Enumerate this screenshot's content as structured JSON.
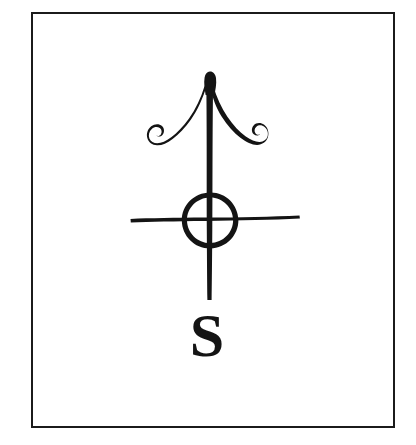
{
  "plate": {
    "name": "sigil-plate",
    "background_color": "#ffffff",
    "ink_color": "#141414",
    "width": 416,
    "height": 445
  },
  "frame": {
    "name": "plate-border",
    "border_color": "#1b1b1b",
    "border_width_px": 2.5,
    "x": 31,
    "y": 12,
    "width": 364,
    "height": 416
  },
  "figure": {
    "name": "alchemical-sigil",
    "elements": [
      {
        "name": "arrow-shaft",
        "label": "Vertical shaft",
        "top_y": 72,
        "bottom_y": 300,
        "center_x": 210
      },
      {
        "name": "arrowhead-tip",
        "label": "Arrow point",
        "x": 210,
        "y": 72
      },
      {
        "name": "left-spiral-barb",
        "label": "Left curled barb",
        "curl_direction": "counterclockwise"
      },
      {
        "name": "right-spiral-barb",
        "label": "Right curled barb",
        "curl_direction": "clockwise"
      },
      {
        "name": "cross-circle",
        "label": "Circle",
        "center_x": 210,
        "center_y": 220,
        "radius": 27
      },
      {
        "name": "horizontal-crossbar",
        "label": "Horizontal bar",
        "left_x": 130,
        "right_x": 300,
        "y": 220
      }
    ]
  },
  "caption": {
    "name": "sigil-letter",
    "text": "S",
    "x": 207,
    "y": 356,
    "font_size_px": 62
  }
}
